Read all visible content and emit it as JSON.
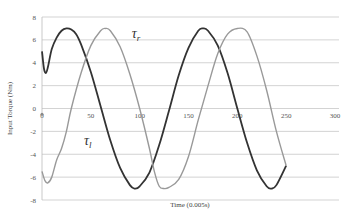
{
  "chart_data": {
    "type": "line",
    "title": "",
    "xlabel": "Time (0.005s)",
    "ylabel": "Input Torque (Nm)",
    "xlim": [
      0,
      300
    ],
    "ylim": [
      -8,
      8
    ],
    "x_ticks": [
      0,
      50,
      100,
      150,
      200,
      250,
      300
    ],
    "y_ticks": [
      8,
      6,
      4,
      2,
      0,
      -2,
      -4,
      -6,
      -8
    ],
    "grid": "horizontal",
    "legend": "inline annotations",
    "annotations": [
      {
        "text": "τ",
        "sub": "r",
        "x": 92,
        "y": 6.2
      },
      {
        "text": "τ",
        "sub": "l",
        "x": 43,
        "y": -3.2
      }
    ],
    "series": [
      {
        "name": "τ_l",
        "color": "#333333",
        "x": [
          0,
          2,
          4,
          6,
          10,
          15,
          20,
          25,
          30,
          35,
          40,
          50,
          60,
          70,
          80,
          90,
          95,
          100,
          110,
          120,
          130,
          140,
          150,
          160,
          165,
          170,
          180,
          190,
          200,
          210,
          220,
          230,
          235,
          240,
          250
        ],
        "y": [
          5,
          3.5,
          3.1,
          3.6,
          5.2,
          6.2,
          6.8,
          7.0,
          6.9,
          6.5,
          5.6,
          3.2,
          0.2,
          -2.8,
          -5.2,
          -6.7,
          -7.0,
          -6.8,
          -5.6,
          -3.2,
          -0.2,
          2.9,
          5.3,
          6.8,
          7.0,
          6.8,
          5.5,
          3.1,
          0.0,
          -3.0,
          -5.4,
          -6.8,
          -7.0,
          -6.7,
          -5.0
        ]
      },
      {
        "name": "τ_r",
        "color": "#999999",
        "x": [
          0,
          3,
          6,
          10,
          15,
          20,
          25,
          30,
          40,
          50,
          60,
          65,
          70,
          80,
          90,
          100,
          110,
          115,
          120,
          125,
          130,
          140,
          150,
          160,
          170,
          180,
          190,
          200,
          210,
          220,
          230,
          240,
          250
        ],
        "y": [
          -5.5,
          -6.3,
          -6.5,
          -6.0,
          -4.5,
          -3.5,
          -2.0,
          0.0,
          3.1,
          5.5,
          6.8,
          7.0,
          6.8,
          5.4,
          3.0,
          0.0,
          -3.5,
          -5.5,
          -6.8,
          -7.0,
          -6.9,
          -6.2,
          -4.2,
          -1.0,
          2.0,
          4.8,
          6.5,
          7.0,
          6.7,
          4.6,
          1.6,
          -2.0,
          -5.0
        ]
      }
    ]
  }
}
